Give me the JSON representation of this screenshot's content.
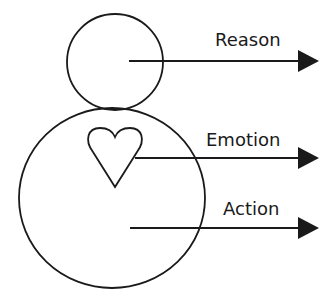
{
  "diagram": {
    "head": {
      "cx": 115,
      "cy": 62,
      "r": 48
    },
    "body": {
      "cx": 112,
      "cy": 198,
      "rx": 93,
      "ry": 90
    },
    "heart": {
      "path": "M115 187 L93 152 C84 140 88 128 100 128 C108 128 113 132 115 137 C117 132 122 128 130 128 C142 128 146 140 137 152 Z"
    },
    "arrows": [
      {
        "label": "Reason",
        "x1": 129,
        "y": 61,
        "x2": 318,
        "label_x": 215,
        "label_y": 46
      },
      {
        "label": "Emotion",
        "x1": 135,
        "y": 158,
        "x2": 318,
        "label_x": 206,
        "label_y": 146
      },
      {
        "label": "Action",
        "x1": 130,
        "y": 228,
        "x2": 318,
        "label_x": 223,
        "label_y": 216
      }
    ],
    "stroke_color": "#1a1a1a"
  },
  "labels": {
    "reason": "Reason",
    "emotion": "Emotion",
    "action": "Action"
  }
}
